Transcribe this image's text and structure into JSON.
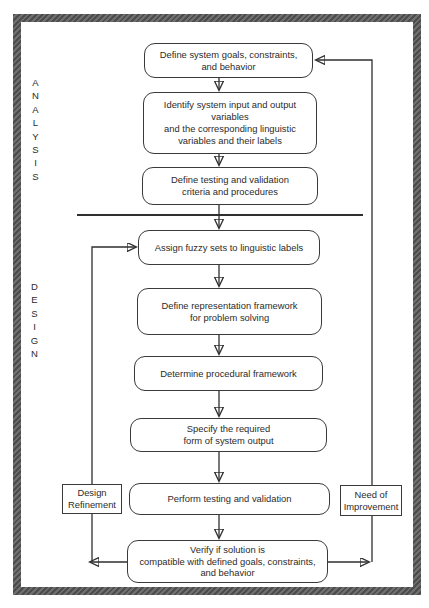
{
  "diagram": {
    "analysis_label": "ANALYSIS",
    "design_label": "DESIGN",
    "flow_steps": [
      {
        "name": "define-goals",
        "text": "Define system goals, constraints,\nand behavior"
      },
      {
        "name": "identify-variables",
        "text": "Identify system input and output\nvariables\nand the corresponding linguistic\nvariables and their labels"
      },
      {
        "name": "define-testing",
        "text": "Define testing and validation\ncriteria and procedures"
      },
      {
        "name": "assign-fuzzy-sets",
        "text": "Assign fuzzy sets to linguistic labels"
      },
      {
        "name": "define-representation",
        "text": "Define representation framework\nfor problem solving"
      },
      {
        "name": "determine-procedural",
        "text": "Determine procedural framework"
      },
      {
        "name": "specify-output",
        "text": "Specify the required\nform of system output"
      },
      {
        "name": "perform-testing",
        "text": "Perform testing and validation"
      },
      {
        "name": "verify-solution",
        "text": "Verify if solution is\ncompatible with defined goals, constraints,\nand behavior"
      }
    ],
    "feedback_labels": {
      "design_refinement": "Design\nRefinement",
      "need_of_improvement": "Need of\nImprovement"
    },
    "colors": {
      "line": "#2f2f2f",
      "box_border": "#3a3a3a",
      "frame": "#5c5c5c",
      "text": "#2b2b2b",
      "background": "#ffffff"
    }
  }
}
